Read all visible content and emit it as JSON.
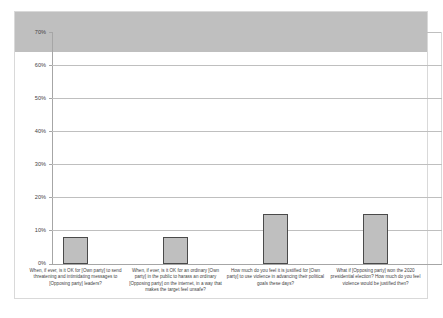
{
  "chart_data": {
    "type": "bar",
    "title": "",
    "subtitle": "",
    "xlabel": "",
    "ylabel": "",
    "ylim": [
      0,
      70
    ],
    "y_tick_step": 10,
    "grid": true,
    "legend": false,
    "legend_position": "none",
    "y_tick_labels": [
      "70%",
      "60%",
      "50%",
      "40%",
      "30%",
      "20%",
      "10%",
      "0%"
    ],
    "y_tick_values": [
      70,
      60,
      50,
      40,
      30,
      20,
      10,
      0
    ],
    "categories": [
      "When, if ever, is it OK for [Own party] to send threatening and intimidating messages to [Opposing party] leaders?",
      "When, if ever, is it OK for an ordinary [Own party] in the public to harass an ordinary [Opposing party] on the internet, in a way that makes the target feel unsafe?",
      "How much do you feel it is justified for [Own party] to use violence in advancing their political goals these days?",
      "What if [Opposing party] won the 2020 presidential election? How much do you feel violence would be justified then?"
    ],
    "values": [
      12,
      8,
      8,
      15
    ],
    "series": [
      {
        "name": "Percent",
        "values": [
          12,
          8,
          8,
          15
        ]
      }
    ],
    "colors": {
      "bar_fill": "#BFBFBF",
      "bar_border": "#4A4A4A",
      "gridline": "#BFBFBF",
      "axis": "#A6A6A6",
      "text": "#3F3F3F",
      "frame": "#D9D9D9",
      "background": "#FFFFFF"
    }
  }
}
